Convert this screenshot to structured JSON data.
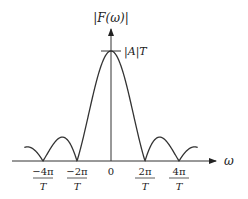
{
  "chart_data": {
    "type": "line",
    "title": "",
    "xlabel": "ω",
    "ylabel": "|F(ω)|",
    "peak_label": "|A|T",
    "function": "|A|T·|sinc(ωT/2)|",
    "x_ticks": [
      {
        "value": -2,
        "num": "−4π",
        "den": "T"
      },
      {
        "value": -1,
        "num": "−2π",
        "den": "T"
      },
      {
        "value": 0,
        "num": "0",
        "den": ""
      },
      {
        "value": 1,
        "num": "2π",
        "den": "T"
      },
      {
        "value": 2,
        "num": "4π",
        "den": "T"
      }
    ],
    "x_unit": "2π/T",
    "x_range": [
      -2.55,
      2.55
    ],
    "ylim": [
      0,
      1
    ],
    "zeros": [
      -2,
      -1,
      1,
      2
    ],
    "peak_value": 1,
    "grid": false,
    "legend": "none",
    "line_color": "#333333"
  }
}
